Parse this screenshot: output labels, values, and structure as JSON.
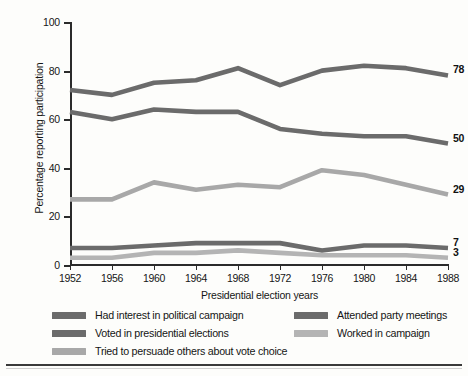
{
  "chart_data": {
    "type": "line",
    "title": "",
    "xlabel": "Presidential election years",
    "ylabel": "Percentage reporting participation",
    "categories": [
      1952,
      1956,
      1960,
      1964,
      1968,
      1972,
      1976,
      1980,
      1984,
      1988
    ],
    "xtick_labels": [
      "1952",
      "1956",
      "1960",
      "1964",
      "1968",
      "1972",
      "1976",
      "1980",
      "1984",
      "1988"
    ],
    "ytick_labels": [
      "0",
      "20",
      "40",
      "60",
      "80",
      "100"
    ],
    "yticks": [
      0,
      20,
      40,
      60,
      80,
      100
    ],
    "ylim": [
      0,
      100
    ],
    "xlim": [
      1952,
      1988
    ],
    "grid": false,
    "legend_position": "below",
    "series": [
      {
        "name": "Had interest in political campaign",
        "color": "#6b6b6b",
        "values": [
          72,
          70,
          75,
          76,
          81,
          74,
          80,
          82,
          81,
          78
        ],
        "end_label": "78"
      },
      {
        "name": "Voted in presidential elections",
        "color": "#6b6b6b",
        "values": [
          63,
          60,
          64,
          63,
          63,
          56,
          54,
          53,
          53,
          50
        ],
        "end_label": "50"
      },
      {
        "name": "Tried to persuade others about vote choice",
        "color": "#a8a8a8",
        "values": [
          27,
          27,
          34,
          31,
          33,
          32,
          39,
          37,
          33,
          29
        ],
        "end_label": "29"
      },
      {
        "name": "Attended party meetings",
        "color": "#6b6b6b",
        "values": [
          7,
          7,
          8,
          9,
          9,
          9,
          6,
          8,
          8,
          7
        ],
        "end_label": "7"
      },
      {
        "name": "Worked in campaign",
        "color": "#b4b4b4",
        "values": [
          3,
          3,
          5,
          5,
          6,
          5,
          4,
          4,
          4,
          3
        ],
        "end_label": "3"
      }
    ]
  },
  "legend": {
    "left_items": [
      {
        "label": "Had interest in political campaign",
        "color": "#6b6b6b"
      },
      {
        "label": "Voted in presidential elections",
        "color": "#6b6b6b"
      },
      {
        "label": "Tried to persuade others about vote choice",
        "color": "#a8a8a8"
      }
    ],
    "right_items": [
      {
        "label": "Attended party meetings",
        "color": "#6b6b6b"
      },
      {
        "label": "Worked in campaign",
        "color": "#b4b4b4"
      }
    ]
  }
}
